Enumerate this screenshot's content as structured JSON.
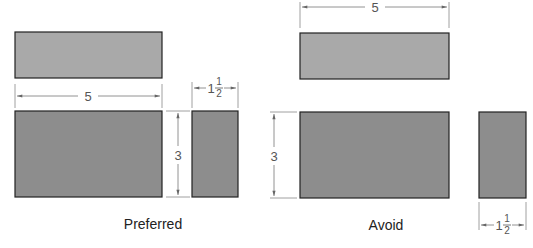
{
  "diagram": {
    "colors": {
      "light_fill": "#a9a9a9",
      "dark_fill": "#8d8d8d",
      "outline": "#222222",
      "dim_line": "#777777"
    },
    "preferred": {
      "label": "Preferred",
      "width_dim": "5",
      "height_dim": "3",
      "depth_dim_whole": "1",
      "depth_dim_num": "1",
      "depth_dim_den": "2"
    },
    "avoid": {
      "label": "Avoid",
      "width_dim": "5",
      "height_dim": "3",
      "depth_dim_whole": "1",
      "depth_dim_num": "1",
      "depth_dim_den": "2"
    }
  }
}
